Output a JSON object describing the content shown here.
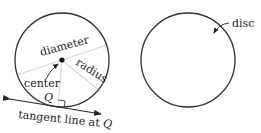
{
  "left_figure": {
    "labels": {
      "diameter": "diameter",
      "radius": "radius",
      "center": "center",
      "point": "Q",
      "tangent_prefix": "tangent line at ",
      "tangent_point": "Q"
    }
  },
  "right_figure": {
    "labels": {
      "disc": "disc"
    }
  },
  "colors": {
    "stroke": "#333333",
    "guide": "#d8d8d8",
    "text": "#222222"
  }
}
